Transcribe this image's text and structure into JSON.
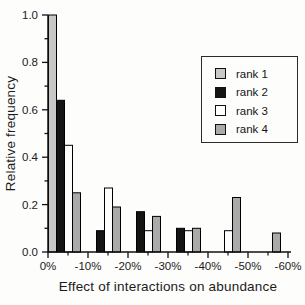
{
  "chart_data": {
    "type": "bar",
    "title": "",
    "xlabel": "Effect of interactions on abundance",
    "ylabel": "Relative frequency",
    "bin_edge_labels": [
      "0%",
      "-10%",
      "-20%",
      "-30%",
      "-40%",
      "-50%",
      "-60%"
    ],
    "categories": [
      "0% to -10%",
      "-10% to -20%",
      "-20% to -30%",
      "-30% to -40%",
      "-40% to -50%",
      "-50% to -60%"
    ],
    "series": [
      {
        "name": "rank 1",
        "color": "#c8c8c8",
        "values": [
          1.0,
          null,
          null,
          null,
          null,
          null
        ]
      },
      {
        "name": "rank 2",
        "color": "#141414",
        "values": [
          0.64,
          0.09,
          0.17,
          0.1,
          null,
          null
        ]
      },
      {
        "name": "rank 3",
        "color": "#ffffff",
        "values": [
          0.45,
          0.27,
          0.09,
          0.09,
          0.09,
          null
        ]
      },
      {
        "name": "rank 4",
        "color": "#aaaaaa",
        "values": [
          0.25,
          0.19,
          0.15,
          0.1,
          0.23,
          0.08
        ]
      }
    ],
    "ylim": [
      0.0,
      1.0
    ],
    "y_tick_labels": [
      "0.0",
      "0.2",
      "0.4",
      "0.6",
      "0.8",
      "1.0"
    ],
    "y_major_step": 0.2,
    "y_minor_step": 0.1,
    "x_minor_ticks_at_bin_midpoints": true,
    "grid": false,
    "legend": {
      "position": "upper right",
      "entries": [
        "rank 1",
        "rank 2",
        "rank 3",
        "rank 4"
      ]
    }
  }
}
